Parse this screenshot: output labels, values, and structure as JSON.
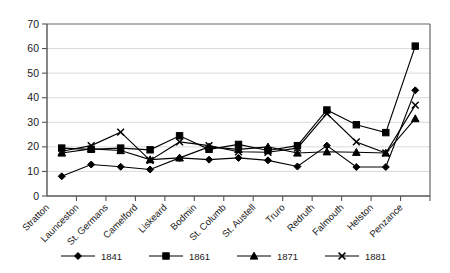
{
  "chart_data": {
    "type": "line",
    "title": "",
    "subtitle": "",
    "xlabel": "",
    "ylabel": "",
    "ylim": [
      0,
      70
    ],
    "ytick_step": 10,
    "yticks": [
      "0",
      "10",
      "20",
      "30",
      "40",
      "50",
      "60",
      "70"
    ],
    "grid": true,
    "legend_position": "bottom",
    "categories": [
      "Stratton",
      "Launceston",
      "St. Germans",
      "Camelford",
      "Liskeard",
      "Bodmin",
      "St. Columb",
      "St. Austell",
      "Truro",
      "Redruth",
      "Falmouth",
      "Helston",
      "Penzance"
    ],
    "series": [
      {
        "name": "1841",
        "marker": "diamond",
        "values": [
          8,
          12.8,
          11.9,
          10.8,
          15.5,
          14.8,
          15.5,
          14.5,
          12,
          20.5,
          11.8,
          11.8,
          43
        ]
      },
      {
        "name": "1861",
        "marker": "square",
        "values": [
          19.5,
          19,
          19.5,
          18.8,
          24.5,
          19,
          21,
          18.5,
          20.5,
          35,
          29,
          25.8,
          61
        ]
      },
      {
        "name": "1871",
        "marker": "triangle",
        "values": [
          17.5,
          19.2,
          18.5,
          14.8,
          15.5,
          20,
          19,
          20,
          17.5,
          18,
          17.8,
          17.5,
          31.5
        ]
      },
      {
        "name": "1881",
        "marker": "cross",
        "values": [
          18.2,
          20.5,
          26,
          14.5,
          22,
          20.5,
          18,
          17.8,
          19.5,
          33.5,
          22,
          17.5,
          37
        ]
      }
    ]
  },
  "legend": {
    "entries": [
      {
        "label": "1841"
      },
      {
        "label": "1861"
      },
      {
        "label": "1871"
      },
      {
        "label": "1881"
      }
    ]
  }
}
